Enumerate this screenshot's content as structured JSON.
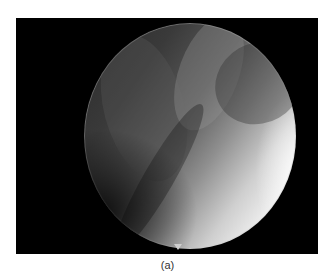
{
  "figure": {
    "panel_label": "(a)",
    "content": "endoscopic-view-circular-image",
    "colors": {
      "frame": "#000000",
      "highlight": "#ffffff",
      "caption": "#333333"
    }
  }
}
